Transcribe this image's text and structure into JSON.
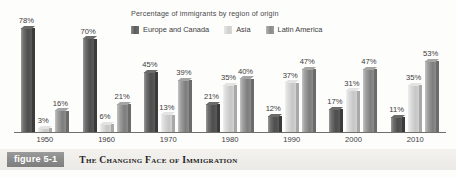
{
  "chart_data": {
    "type": "bar",
    "title": "Percentage of immigrants by region of origin",
    "xlabel": "",
    "ylabel": "",
    "ylim": [
      0,
      78
    ],
    "grid": false,
    "legend_position": "top",
    "categories": [
      "1950",
      "1960",
      "1970",
      "1980",
      "1990",
      "2000",
      "2010"
    ],
    "series": [
      {
        "name": "Europe and Canada",
        "color": "#4d4d4d",
        "values": [
          78,
          70,
          45,
          21,
          12,
          17,
          11
        ],
        "labels": [
          "78%",
          "70%",
          "45%",
          "21%",
          "12%",
          "17%",
          "11%"
        ]
      },
      {
        "name": "Asia",
        "color": "#c6c6c6",
        "values": [
          3,
          6,
          13,
          35,
          37,
          31,
          35
        ],
        "labels": [
          "3%",
          "6%",
          "13%",
          "35%",
          "37%",
          "31%",
          "35%"
        ]
      },
      {
        "name": "Latin America",
        "color": "#7e7e7e",
        "values": [
          16,
          21,
          39,
          40,
          47,
          47,
          53
        ],
        "labels": [
          "16%",
          "21%",
          "39%",
          "40%",
          "47%",
          "47%",
          "53%"
        ]
      }
    ]
  },
  "legend": {
    "title": "Percentage of immigrants by region of origin",
    "items": [
      {
        "label": "Europe and Canada",
        "swatch": "legend-swatch-europe-canada"
      },
      {
        "label": "Asia",
        "swatch": "legend-swatch-asia"
      },
      {
        "label": "Latin America",
        "swatch": "legend-swatch-latin-america"
      }
    ]
  },
  "caption": {
    "badge": "figure 5-1",
    "text": "The Changing Face of Immigration"
  }
}
